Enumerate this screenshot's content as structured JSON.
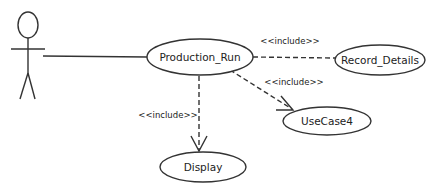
{
  "diagram": {
    "type": "uml-use-case",
    "colors": {
      "line": "#333333",
      "text": "#222222",
      "background": "#ffffff"
    },
    "actor": {
      "name": ""
    },
    "use_cases": [
      {
        "id": "production_run",
        "label": "Production_Run"
      },
      {
        "id": "record_details",
        "label": "Record_Details"
      },
      {
        "id": "usecase4",
        "label": "UseCase4"
      },
      {
        "id": "display",
        "label": "Display"
      }
    ],
    "relationships": [
      {
        "type": "association",
        "from": "actor",
        "to": "production_run",
        "label": ""
      },
      {
        "type": "include",
        "from": "production_run",
        "to": "record_details",
        "label": "<<include>>"
      },
      {
        "type": "include",
        "from": "production_run",
        "to": "usecase4",
        "label": "<<include>>"
      },
      {
        "type": "include",
        "from": "production_run",
        "to": "display",
        "label": "<<include>>"
      }
    ]
  }
}
